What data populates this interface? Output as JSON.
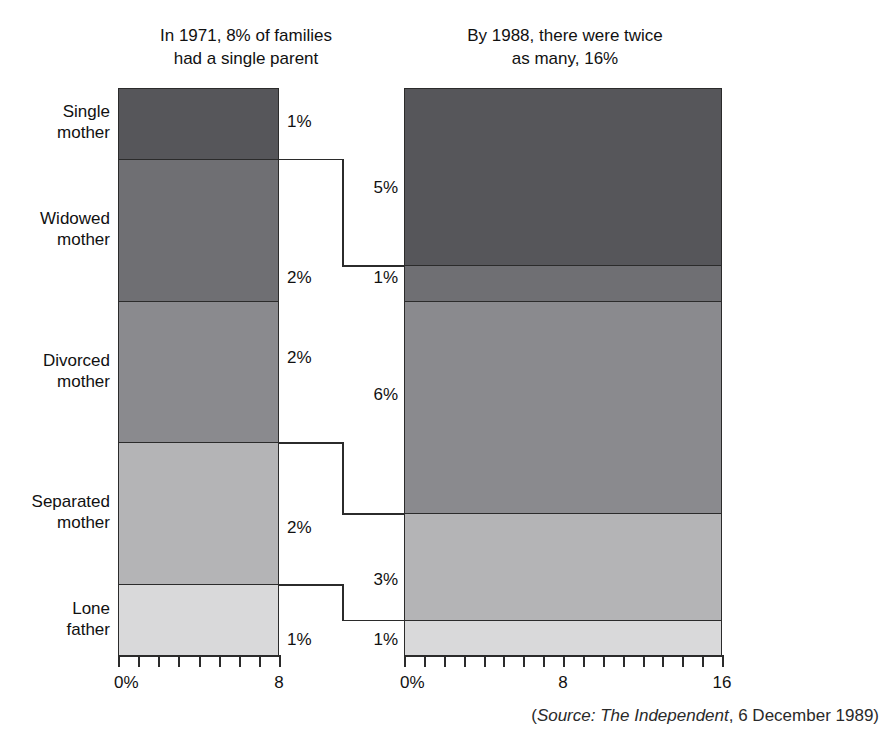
{
  "titles": {
    "left": "In 1971, 8% of families\nhad a single parent",
    "right": "By 1988, there were twice\nas many, 16%"
  },
  "categories": [
    {
      "key": "single-mother",
      "label": "Single\nmother"
    },
    {
      "key": "widowed-mother",
      "label": "Widowed\nmother"
    },
    {
      "key": "divorced-mother",
      "label": "Divorced\nmother"
    },
    {
      "key": "separated-mother",
      "label": "Separated\nmother"
    },
    {
      "key": "lone-father",
      "label": "Lone\nfather"
    }
  ],
  "value_labels": {
    "left": [
      "1%",
      "2%",
      "2%",
      "2%",
      "1%"
    ],
    "right": [
      "5%",
      "1%",
      "6%",
      "3%",
      "1%"
    ]
  },
  "axes": {
    "left": {
      "ticks": [
        "0%",
        "8"
      ],
      "tick_count": 9,
      "max": 8
    },
    "right": {
      "ticks": [
        "0%",
        "8",
        "16"
      ],
      "tick_count": 17,
      "max": 16
    }
  },
  "source": {
    "open": "(",
    "italic": "Source: The Independent",
    "rest": ", 6 December 1989)"
  },
  "colors": {
    "single-mother": "#56565a",
    "widowed-mother": "#6f6f73",
    "divorced-mother": "#8a8a8e",
    "separated-mother": "#b4b4b6",
    "lone-father": "#d9d9da",
    "outline": "#2b2b2b",
    "text": "#111111"
  },
  "chart_data": {
    "type": "bar",
    "subtitle": "",
    "xlabel": "",
    "ylabel": "",
    "orientation": "stacked-vertical",
    "categories": [
      "Single mother",
      "Widowed mother",
      "Divorced mother",
      "Separated mother",
      "Lone father"
    ],
    "series": [
      {
        "name": "In 1971, 8% of families had a single parent",
        "total": 8,
        "axis_max": 8,
        "axis_ticks": [
          0,
          8
        ],
        "values": [
          1,
          2,
          2,
          2,
          1
        ],
        "value_labels": [
          "1%",
          "2%",
          "2%",
          "2%",
          "1%"
        ]
      },
      {
        "name": "By 1988, there were twice as many, 16%",
        "total": 16,
        "axis_max": 16,
        "axis_ticks": [
          0,
          8,
          16
        ],
        "values": [
          5,
          1,
          6,
          3,
          1
        ],
        "value_labels": [
          "5%",
          "1%",
          "6%",
          "3%",
          "1%"
        ]
      }
    ],
    "units": "% of families",
    "grid": false,
    "legend": "none",
    "annotations": [
      "(Source: The Independent, 6 December 1989)"
    ]
  }
}
